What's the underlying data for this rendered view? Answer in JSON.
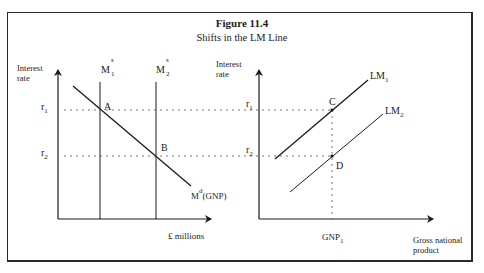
{
  "figure": {
    "title": "Figure 11.4",
    "subtitle": "Shifts in the LM Line"
  },
  "left_panel": {
    "y_axis_label_line1": "Interest",
    "y_axis_label_line2": "rate",
    "x_axis_label": "£ millions",
    "r1_label": {
      "base": "r",
      "sub": "1"
    },
    "r2_label": {
      "base": "r",
      "sub": "2"
    },
    "ms1_label": {
      "base": "M",
      "sup": "s",
      "sub": "1"
    },
    "ms2_label": {
      "base": "M",
      "sup": "s",
      "sub": "2"
    },
    "md_label": {
      "base": "M",
      "sup": "d",
      "suffix": "(GNP)"
    },
    "point_a": "A",
    "point_b": "B"
  },
  "right_panel": {
    "y_axis_label_line1": "Interest",
    "y_axis_label_line2": "rate",
    "x_axis_label_line1": "Gross national",
    "x_axis_label_line2": "product",
    "r1_label": {
      "base": "r",
      "sub": "1"
    },
    "r2_label": {
      "base": "r",
      "sub": "2"
    },
    "lm1_label": {
      "base": "LM",
      "sub": "1"
    },
    "lm2_label": {
      "base": "LM",
      "sub": "2"
    },
    "gnp1_label": {
      "base": "GNP",
      "sub": "1"
    },
    "point_c": "C",
    "point_d": "D"
  },
  "colors": {
    "line": "#1a1a1a",
    "dotted": "#555555",
    "frame": "#2a2a2a"
  }
}
